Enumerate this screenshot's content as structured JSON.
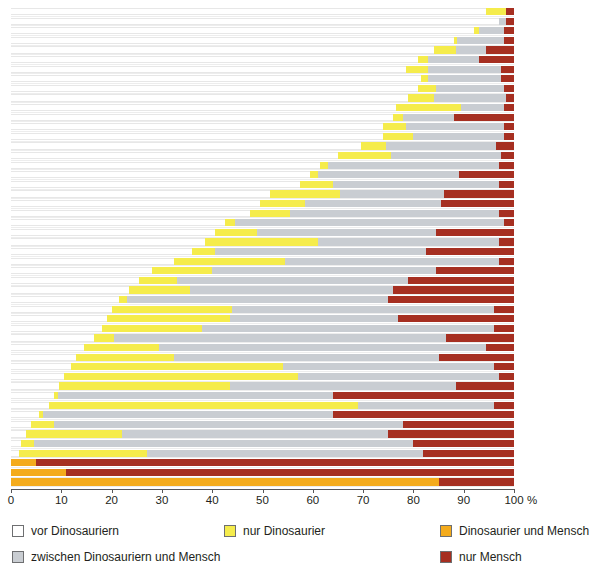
{
  "chart_data": {
    "type": "bar",
    "orientation": "horizontal",
    "stacked": true,
    "title": "",
    "subtitle": "",
    "xlabel": "%",
    "ylabel": "",
    "xlim": [
      0,
      100
    ],
    "xticks": [
      0,
      10,
      20,
      30,
      40,
      50,
      60,
      70,
      80,
      90,
      100
    ],
    "xtick_labels": [
      "0",
      "10",
      "20",
      "30",
      "40",
      "50",
      "60",
      "70",
      "80",
      "90",
      "100"
    ],
    "axis_unit": "%",
    "grid": false,
    "legend_position": "bottom",
    "series": [
      {
        "name": "vor Dinosauriern",
        "color": "#ffffff"
      },
      {
        "name": "nur Dinosaurier",
        "color": "#f5ec4c"
      },
      {
        "name": "Dinosaurier und Mensch",
        "color": "#f4ab1c"
      },
      {
        "name": "zwischen Dinosauriern und Mensch",
        "color": "#c9cdd2"
      },
      {
        "name": "nur Mensch",
        "color": "#a62f21"
      }
    ],
    "categories": [
      "r1",
      "r2",
      "r3",
      "r4",
      "r5",
      "r6",
      "r7",
      "r8",
      "r9",
      "r10",
      "r11",
      "r12",
      "r13",
      "r14",
      "r15",
      "r16",
      "r17",
      "r18",
      "r19",
      "r20",
      "r21",
      "r22",
      "r23",
      "r24",
      "r25",
      "r26",
      "r27",
      "r28",
      "r29",
      "r30",
      "r31",
      "r32",
      "r33",
      "r34",
      "r35",
      "r36",
      "r37",
      "r38",
      "r39",
      "r40",
      "r41",
      "r42",
      "r43",
      "r44",
      "r45",
      "r46",
      "r47",
      "r48",
      "r49",
      "r50"
    ],
    "rows": [
      {
        "pre": 94.5,
        "dino": 4.0,
        "both": 0,
        "betw": 0.0,
        "human": 1.5
      },
      {
        "pre": 97.0,
        "dino": 0.0,
        "both": 0,
        "betw": 1.5,
        "human": 1.5
      },
      {
        "pre": 92.0,
        "dino": 1.0,
        "both": 0,
        "betw": 5.0,
        "human": 2.0
      },
      {
        "pre": 88.0,
        "dino": 0.7,
        "both": 0,
        "betw": 9.3,
        "human": 2.0
      },
      {
        "pre": 84.0,
        "dino": 4.5,
        "both": 0,
        "betw": 6.0,
        "human": 5.5
      },
      {
        "pre": 81.0,
        "dino": 2.0,
        "both": 0,
        "betw": 10.0,
        "human": 7.0
      },
      {
        "pre": 78.5,
        "dino": 4.5,
        "both": 0,
        "betw": 14.5,
        "human": 2.5
      },
      {
        "pre": 81.5,
        "dino": 1.5,
        "both": 0,
        "betw": 14.5,
        "human": 2.5
      },
      {
        "pre": 81.0,
        "dino": 3.5,
        "both": 0,
        "betw": 13.5,
        "human": 2.0
      },
      {
        "pre": 79.0,
        "dino": 5.0,
        "both": 0,
        "betw": 14.5,
        "human": 1.5
      },
      {
        "pre": 76.5,
        "dino": 13.0,
        "both": 0,
        "betw": 8.5,
        "human": 2.0
      },
      {
        "pre": 76.0,
        "dino": 2.0,
        "both": 0,
        "betw": 10.0,
        "human": 12.0
      },
      {
        "pre": 74.0,
        "dino": 4.5,
        "both": 0,
        "betw": 19.5,
        "human": 2.0
      },
      {
        "pre": 74.0,
        "dino": 6.0,
        "both": 0,
        "betw": 18.0,
        "human": 2.0
      },
      {
        "pre": 69.5,
        "dino": 5.0,
        "both": 0,
        "betw": 22.0,
        "human": 3.5
      },
      {
        "pre": 65.0,
        "dino": 10.5,
        "both": 0,
        "betw": 22.0,
        "human": 2.5
      },
      {
        "pre": 61.5,
        "dino": 1.5,
        "both": 0,
        "betw": 34.0,
        "human": 3.0
      },
      {
        "pre": 59.5,
        "dino": 1.5,
        "both": 0,
        "betw": 28.0,
        "human": 11.0
      },
      {
        "pre": 57.5,
        "dino": 6.5,
        "both": 0,
        "betw": 33.0,
        "human": 3.0
      },
      {
        "pre": 51.5,
        "dino": 14.0,
        "both": 0,
        "betw": 20.5,
        "human": 14.0
      },
      {
        "pre": 49.5,
        "dino": 9.0,
        "both": 0,
        "betw": 27.0,
        "human": 14.5
      },
      {
        "pre": 47.5,
        "dino": 8.0,
        "both": 0,
        "betw": 41.5,
        "human": 3.0
      },
      {
        "pre": 42.5,
        "dino": 2.0,
        "both": 0,
        "betw": 53.5,
        "human": 2.0
      },
      {
        "pre": 40.5,
        "dino": 8.5,
        "both": 0,
        "betw": 35.5,
        "human": 15.5
      },
      {
        "pre": 38.5,
        "dino": 22.5,
        "both": 0,
        "betw": 36.0,
        "human": 3.0
      },
      {
        "pre": 36.0,
        "dino": 4.5,
        "both": 0,
        "betw": 42.0,
        "human": 17.5
      },
      {
        "pre": 32.5,
        "dino": 22.0,
        "both": 0,
        "betw": 42.5,
        "human": 3.0
      },
      {
        "pre": 28.0,
        "dino": 12.0,
        "both": 0,
        "betw": 44.5,
        "human": 15.5
      },
      {
        "pre": 25.5,
        "dino": 7.5,
        "both": 0,
        "betw": 46.0,
        "human": 21.0
      },
      {
        "pre": 23.5,
        "dino": 12.0,
        "both": 0,
        "betw": 40.5,
        "human": 24.0
      },
      {
        "pre": 21.5,
        "dino": 1.5,
        "both": 0,
        "betw": 52.0,
        "human": 25.0
      },
      {
        "pre": 20.0,
        "dino": 24.0,
        "both": 0,
        "betw": 52.0,
        "human": 4.0
      },
      {
        "pre": 19.0,
        "dino": 24.5,
        "both": 0,
        "betw": 33.5,
        "human": 23.0
      },
      {
        "pre": 18.0,
        "dino": 20.0,
        "both": 0,
        "betw": 58.0,
        "human": 4.0
      },
      {
        "pre": 16.5,
        "dino": 4.0,
        "both": 0,
        "betw": 66.0,
        "human": 13.5
      },
      {
        "pre": 14.5,
        "dino": 15.0,
        "both": 0,
        "betw": 65.0,
        "human": 5.5
      },
      {
        "pre": 13.0,
        "dino": 19.5,
        "both": 0,
        "betw": 52.5,
        "human": 15.0
      },
      {
        "pre": 12.0,
        "dino": 42.0,
        "both": 0,
        "betw": 42.0,
        "human": 4.0
      },
      {
        "pre": 10.5,
        "dino": 46.5,
        "both": 0,
        "betw": 40.0,
        "human": 3.0
      },
      {
        "pre": 9.5,
        "dino": 34.0,
        "both": 0,
        "betw": 45.0,
        "human": 11.5
      },
      {
        "pre": 8.5,
        "dino": 0.8,
        "both": 0,
        "betw": 54.7,
        "human": 36.0
      },
      {
        "pre": 7.5,
        "dino": 61.5,
        "both": 0,
        "betw": 27.0,
        "human": 4.0
      },
      {
        "pre": 5.5,
        "dino": 0.8,
        "both": 0,
        "betw": 57.7,
        "human": 36.0
      },
      {
        "pre": 4.0,
        "dino": 4.5,
        "both": 0,
        "betw": 69.5,
        "human": 22.0
      },
      {
        "pre": 3.0,
        "dino": 19.0,
        "both": 0,
        "betw": 53.0,
        "human": 25.0
      },
      {
        "pre": 2.0,
        "dino": 2.5,
        "both": 0,
        "betw": 75.5,
        "human": 20.0
      },
      {
        "pre": 1.5,
        "dino": 25.5,
        "both": 0,
        "betw": 55.0,
        "human": 18.0
      },
      {
        "pre": 0.0,
        "dino": 0.0,
        "both": 5.0,
        "betw": 0.0,
        "human": 95.0
      },
      {
        "pre": 0.0,
        "dino": 0.0,
        "both": 11.0,
        "betw": 0.0,
        "human": 89.0
      },
      {
        "pre": 0.0,
        "dino": 0.0,
        "both": 85.0,
        "betw": 0.0,
        "human": 15.0
      }
    ]
  },
  "legend": {
    "items": [
      {
        "label": "vor Dinosauriern",
        "key": "pre",
        "col": 0,
        "row": 0
      },
      {
        "label": "nur Dinosaurier",
        "key": "dino",
        "col": 1,
        "row": 0
      },
      {
        "label": "Dinosaurier und Mensch",
        "key": "both",
        "col": 2,
        "row": 0
      },
      {
        "label": "zwischen Dinosauriern und Mensch",
        "key": "betw",
        "col": 0,
        "row": 1
      },
      {
        "label": "nur Mensch",
        "key": "human",
        "col": 2,
        "row": 1
      }
    ]
  },
  "colors": {
    "pre": "#ffffff",
    "dino": "#f5ec4c",
    "both": "#f4ab1c",
    "betw": "#c9cdd2",
    "human": "#a62f21",
    "axis": "#58585a",
    "guide": "#ededed",
    "text": "#231f20"
  }
}
